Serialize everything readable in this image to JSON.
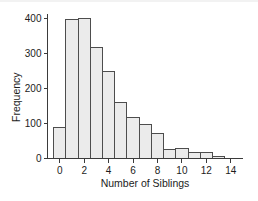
{
  "chart_data": {
    "type": "bar",
    "title": "",
    "subtitle": "",
    "xlabel": "Number of Siblings",
    "ylabel": "Frequency",
    "categories": [
      0,
      1,
      2,
      3,
      4,
      5,
      6,
      7,
      8,
      9,
      10,
      11,
      12,
      13
    ],
    "values": [
      88,
      396,
      401,
      316,
      249,
      159,
      116,
      97,
      72,
      25,
      28,
      18,
      16,
      6
    ],
    "xlim": [
      -1,
      15
    ],
    "ylim": [
      0,
      420
    ],
    "xticks": [
      0,
      2,
      4,
      6,
      8,
      10,
      12,
      14
    ],
    "xtick_labels": [
      "0",
      "2",
      "4",
      "6",
      "8",
      "10",
      "12",
      "14"
    ],
    "yticks": [
      0,
      100,
      200,
      300,
      400
    ],
    "ytick_labels": [
      "0",
      "100",
      "200",
      "300",
      "400"
    ],
    "grid": false,
    "legend": false,
    "legend_position": "none",
    "bar_fill_color": "#ebebeb",
    "bar_edge_color": "#4d4d4d",
    "axis_color": "#3b3b3b",
    "bar_width": 1,
    "bars_centered_on_ticks": true
  },
  "axes": {
    "y_label": "Frequency",
    "x_label": "Number of Siblings",
    "y_tick_0": "0",
    "y_tick_100": "100",
    "y_tick_200": "200",
    "y_tick_300": "300",
    "y_tick_400": "400",
    "x_tick_0": "0",
    "x_tick_2": "2",
    "x_tick_4": "4",
    "x_tick_6": "6",
    "x_tick_8": "8",
    "x_tick_10": "10",
    "x_tick_12": "12",
    "x_tick_14": "14"
  }
}
